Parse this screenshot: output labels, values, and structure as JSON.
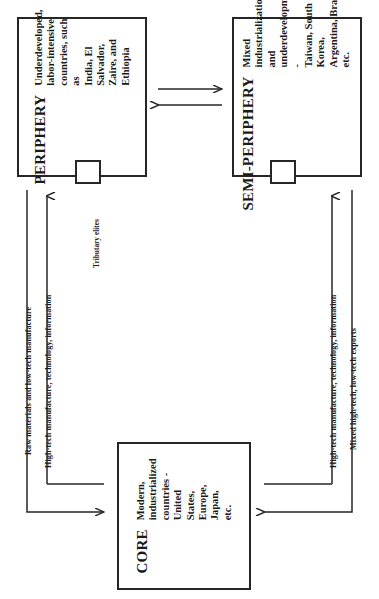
{
  "diagram": {
    "orientation": "rotated-90-ccw",
    "stroke_color": "#262626",
    "background_color": "#ffffff",
    "boxes": [
      {
        "id": "periphery",
        "title": "PERIPHERY",
        "body": "Underdeveloped,\nlabor-intensive\ncountries, such as\nIndia, El Salvador,\nZaire, and Ethiopia"
      },
      {
        "id": "semi-periphery",
        "title": "SEMI-PERIPHERY",
        "body": "Mixed industrialization\nand underdevelopment -\nTaiwan, South Korea,\nArgentina, Brazil, etc."
      },
      {
        "id": "core",
        "title": "CORE",
        "body": "Modern, industrialized\ncountries - United\nStates, Europe, Japan,\netc."
      }
    ],
    "nodes": [
      {
        "id": "periphery-node",
        "label": "Tributary elites"
      },
      {
        "id": "semi-periphery-node",
        "label": ""
      }
    ],
    "flow_labels": [
      {
        "id": "flow-raw-materials",
        "text": "Raw materials and low-tech manufacture"
      },
      {
        "id": "flow-high-tech-left",
        "text": "High-tech manufacture, technology, information"
      },
      {
        "id": "flow-tributary-elites",
        "text": "Tributary elites"
      },
      {
        "id": "flow-high-tech-right",
        "text": "High-tech manufacture, technology, information"
      },
      {
        "id": "flow-mixed-exports",
        "text": "Mixed high-tech, low-tech exports"
      }
    ],
    "connectors": [
      {
        "id": "periphery-to-semi-periphery",
        "direction": "left-to-right"
      },
      {
        "id": "semi-periphery-to-periphery",
        "direction": "right-to-left"
      },
      {
        "id": "periphery-to-core",
        "direction": "into-core-left"
      },
      {
        "id": "core-to-periphery",
        "direction": "out-of-core-left"
      },
      {
        "id": "semi-periphery-to-core",
        "direction": "into-core-right"
      },
      {
        "id": "core-to-semi-periphery",
        "direction": "out-of-core-right"
      }
    ]
  }
}
